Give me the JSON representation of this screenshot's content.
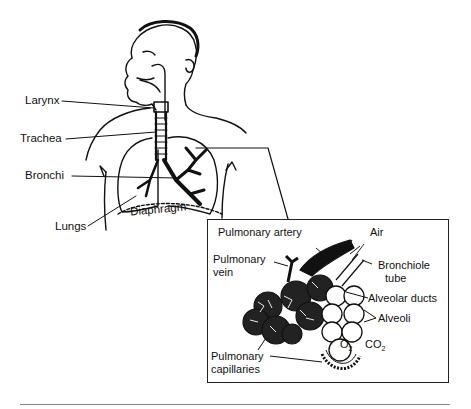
{
  "figure": {
    "main_labels": {
      "larynx": "Larynx",
      "trachea": "Trachea",
      "bronchi": "Bronchi",
      "lungs": "Lungs",
      "diaphragm": "Diaphragm"
    },
    "inset_labels": {
      "pulmonary_artery": "Pulmonary artery",
      "air": "Air",
      "pulmonary_vein_1": "Pulmonary",
      "pulmonary_vein_2": "vein",
      "bronchiole_1": "Bronchiole",
      "bronchiole_2": "tube",
      "alveolar_ducts": "Alveolar ducts",
      "alveoli": "Alveoli",
      "o2": "O",
      "o2_sub": "2",
      "co2": "CO",
      "co2_sub": "2",
      "capillaries_1": "Pulmonary",
      "capillaries_2": "capillaries"
    }
  }
}
